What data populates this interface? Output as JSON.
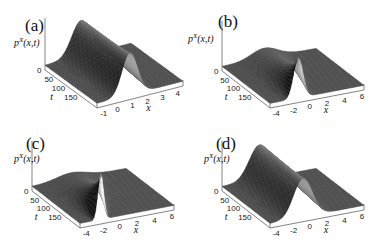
{
  "figure": {
    "panels": [
      {
        "label": "(a)",
        "zlabel": "p^X(x,t)",
        "xlabel": "x",
        "tlabel": "t",
        "t_ticks": [
          "0",
          "50",
          "100",
          "150"
        ],
        "x_ticks": [
          "-1",
          "0",
          "1",
          "2",
          "3",
          "4"
        ]
      },
      {
        "label": "(b)",
        "zlabel": "p^X(x,t)",
        "xlabel": "x",
        "tlabel": "t",
        "t_ticks": [
          "0",
          "50",
          "100",
          "150"
        ],
        "x_ticks": [
          "-4",
          "-2",
          "0",
          "2",
          "4",
          "6"
        ]
      },
      {
        "label": "(c)",
        "zlabel": "p^X(x,t)",
        "xlabel": "x",
        "tlabel": "t",
        "t_ticks": [
          "0",
          "50",
          "100",
          "150"
        ],
        "x_ticks": [
          "-4",
          "-2",
          "0",
          "2",
          "4",
          "6"
        ]
      },
      {
        "label": "(d)",
        "zlabel": "p^X(x,t)",
        "xlabel": "x",
        "tlabel": "t",
        "t_ticks": [
          "0",
          "50",
          "100",
          "150"
        ],
        "x_ticks": [
          "-4",
          "-2",
          "0",
          "2",
          "4",
          "6"
        ]
      }
    ]
  },
  "chart_data": [
    {
      "type": "surface",
      "title": "(a)",
      "xlabel": "x",
      "ylabel": "t",
      "zlabel": "p^X(x,t)",
      "xlim": [
        -1.5,
        4
      ],
      "tlim": [
        0,
        200
      ],
      "x_ticks": [
        -1,
        0,
        1,
        2,
        3,
        4
      ],
      "t_ticks": [
        0,
        50,
        100,
        150
      ],
      "description": "Gaussian-like ridge in x centered near x≈1 persisting over t; peak height roughly constant, grayscale shading"
    },
    {
      "type": "surface",
      "title": "(b)",
      "xlabel": "x",
      "ylabel": "t",
      "zlabel": "p^X(x,t)",
      "xlim": [
        -5,
        6
      ],
      "tlim": [
        0,
        200
      ],
      "x_ticks": [
        -4,
        -2,
        0,
        2,
        4,
        6
      ],
      "t_ticks": [
        0,
        50,
        100,
        150
      ],
      "description": "Sharp peak at small t near x≈-2, broadening and decaying as t increases"
    },
    {
      "type": "surface",
      "title": "(c)",
      "xlabel": "x",
      "ylabel": "t",
      "zlabel": "p^X(x,t)",
      "xlim": [
        -5,
        6
      ],
      "tlim": [
        0,
        200
      ],
      "x_ticks": [
        -4,
        -2,
        0,
        2,
        4,
        6
      ],
      "t_ticks": [
        0,
        50,
        100,
        150
      ],
      "description": "Tall narrow peak at t≈0 near x≈-3, rapidly spreading and flattening with t"
    },
    {
      "type": "surface",
      "title": "(d)",
      "xlabel": "x",
      "ylabel": "t",
      "zlabel": "p^X(x,t)",
      "xlim": [
        -5,
        6
      ],
      "tlim": [
        0,
        200
      ],
      "x_ticks": [
        -4,
        -2,
        0,
        2,
        4,
        6
      ],
      "t_ticks": [
        0,
        50,
        100,
        150
      ],
      "description": "Broad ridge near x≈-1 persisting over t with roughly constant height"
    }
  ]
}
